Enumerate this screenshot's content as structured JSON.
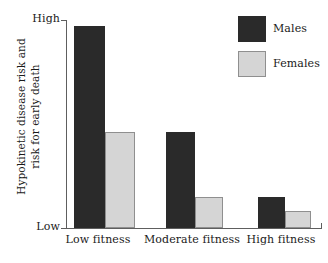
{
  "chart_data": {
    "type": "bar",
    "title": "",
    "subtitle": "",
    "xlabel": "",
    "ylabel_lines": [
      "Hypokinetic disease risk and",
      "risk for early death"
    ],
    "ylabel": "Hypokinetic disease risk and risk for early death",
    "categories": [
      "Low fitness",
      "Moderate fitness",
      "High fitness"
    ],
    "series": [
      {
        "name": "Males",
        "color": "#2a2a2a",
        "values": [
          97,
          46,
          15
        ]
      },
      {
        "name": "Females",
        "color": "#d5d5d5",
        "values": [
          46,
          15,
          8
        ]
      }
    ],
    "ylim": [
      0,
      100
    ],
    "y_tick_labels": [
      "High",
      "Low"
    ],
    "y_tick_high": "High",
    "y_tick_low": "Low",
    "grid": false,
    "legend_position": "top-right",
    "legend_entries": [
      {
        "label": "Males",
        "color": "#2a2a2a"
      },
      {
        "label": "Females",
        "color": "#d5d5d5"
      }
    ],
    "axis_color": "#5e5e5e",
    "background": "#ffffff"
  }
}
